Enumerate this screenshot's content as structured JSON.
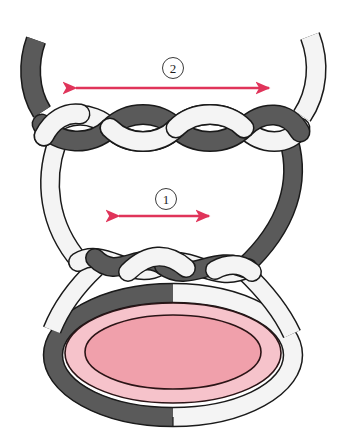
{
  "figure": {
    "background_color": "#ffffff"
  },
  "colors": {
    "dark_strand_fill": "#5a5a5a",
    "dark_strand_stroke": "#1a1a1a",
    "light_strand_fill": "#f4f4f4",
    "light_strand_stroke": "#1a1a1a",
    "arrow_color": "#e0345a",
    "outer_ring_pink": "#f6c3cb",
    "inner_oval_pink": "#f0a0ab",
    "oval_outline": "#2b1416"
  },
  "callouts": [
    {
      "id": "callout-1",
      "label": "1",
      "name": "callout-marker-1",
      "x": 155,
      "y": 188
    },
    {
      "id": "callout-2",
      "label": "2",
      "name": "callout-marker-2",
      "x": 162,
      "y": 57
    }
  ],
  "arrows": [
    {
      "id": "arrow-2",
      "name": "measure-arrow-2",
      "style": "double-headed",
      "color": "#e0345a",
      "x1": 70,
      "x2": 275,
      "y": 88,
      "related_callout": "2"
    },
    {
      "id": "arrow-1",
      "name": "measure-arrow-1",
      "style": "double-headed",
      "color": "#e0345a",
      "x1": 113,
      "x2": 215,
      "y": 216,
      "related_callout": "1"
    }
  ],
  "elements": {
    "dark_strand_name": "dark-suture-strand",
    "light_strand_name": "light-suture-strand",
    "upper_braid_name": "upper-twisted-throws",
    "lower_braid_name": "lower-twisted-throw",
    "tissue_ring_name": "tissue-oval-ring",
    "tissue_inner_name": "tissue-oval-inner"
  }
}
